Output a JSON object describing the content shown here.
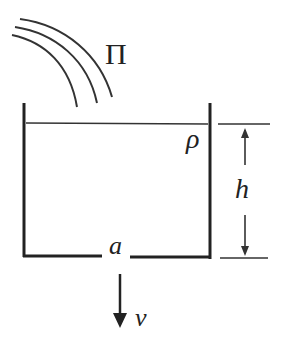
{
  "diagram": {
    "type": "physics-tank-outflow",
    "labels": {
      "stream": "Π",
      "density": "ρ",
      "height": "h",
      "hole_area": "a",
      "velocity": "v"
    },
    "colors": {
      "stroke": "#222222",
      "background": "#ffffff"
    }
  }
}
